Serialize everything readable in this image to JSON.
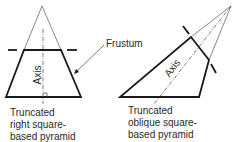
{
  "labels": {
    "frustum": "Frustum",
    "axis_left": "Axis",
    "axis_right": "Axis"
  },
  "captions": {
    "left": [
      "Truncated",
      "right square-",
      "based pyramid"
    ],
    "right": [
      "Truncated",
      "oblique square-",
      "based pyramid"
    ]
  },
  "colors": {
    "stroke": "#1a1a1a",
    "thin": "#444444",
    "background": "#ffffff"
  }
}
